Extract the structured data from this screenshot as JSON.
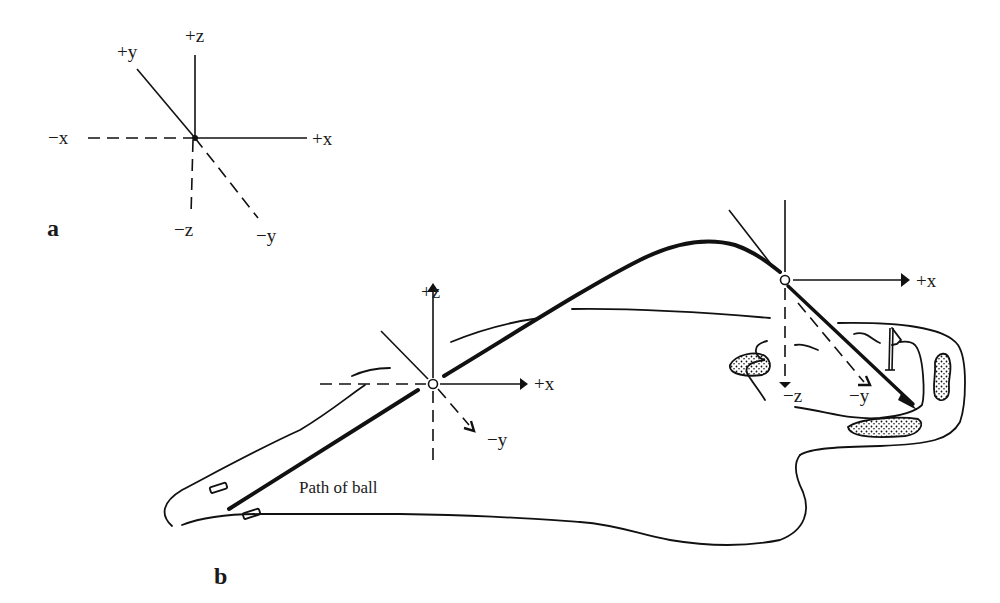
{
  "figure": {
    "panel_a": {
      "label": "a",
      "axes": {
        "pos_x": "+x",
        "neg_x": "−x",
        "pos_y": "+y",
        "neg_y": "−y",
        "pos_z": "+z",
        "neg_z": "−z"
      }
    },
    "panel_b": {
      "label": "b",
      "caption": "Path of ball",
      "frame_launch": {
        "pos_x": "+x",
        "neg_y": "−y",
        "pos_z": "+z"
      },
      "frame_apex": {
        "pos_x": "+x",
        "neg_y": "−y",
        "neg_z": "−z"
      }
    }
  }
}
